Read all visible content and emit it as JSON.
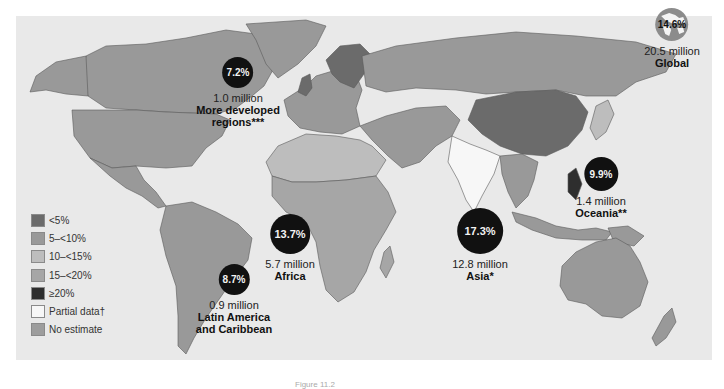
{
  "map": {
    "title": "Prevalence by region",
    "colors": {
      "lt5": "#6b6b6b",
      "5_10": "#999999",
      "10_15": "#bdbdbd",
      "15_20": "#a6a6a6",
      "gte20": "#2e2e2e",
      "partial": "#f7f7f7",
      "no_estimate": "#9d9d9d",
      "ocean": "#e9e9e9",
      "bubble": "#111111"
    }
  },
  "legend": {
    "items": [
      {
        "label": "<5%",
        "key": "lt5"
      },
      {
        "label": "5–<10%",
        "key": "5_10"
      },
      {
        "label": "10–<15%",
        "key": "10_15"
      },
      {
        "label": "15–<20%",
        "key": "15_20"
      },
      {
        "label": "≥20%",
        "key": "gte20"
      },
      {
        "label": "Partial data†",
        "key": "partial"
      },
      {
        "label": "No estimate",
        "key": "no_estimate"
      }
    ]
  },
  "regions": {
    "global": {
      "pct": "14.6%",
      "count": "20.5 million",
      "name": "Global",
      "icon": "globe-icon"
    },
    "more_developed": {
      "pct": "7.2%",
      "count": "1.0 million",
      "name_line1": "More developed",
      "name_line2": "regions***"
    },
    "oceania": {
      "pct": "9.9%",
      "count": "1.4 million",
      "name": "Oceania**"
    },
    "asia": {
      "pct": "17.3%",
      "count": "12.8 million",
      "name": "Asia*"
    },
    "africa": {
      "pct": "13.7%",
      "count": "5.7 million",
      "name": "Africa"
    },
    "latin_america": {
      "pct": "8.7%",
      "count": "0.9 million",
      "name_line1": "Latin America",
      "name_line2": "and Caribbean"
    }
  },
  "caption": "Figure 11.2"
}
